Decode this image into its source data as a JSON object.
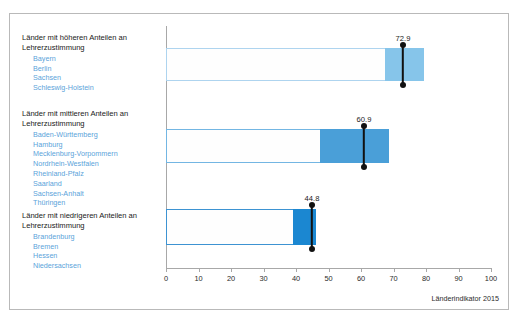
{
  "chart_data": {
    "type": "bar",
    "title": "",
    "xlabel": "",
    "ylabel": "",
    "xlim": [
      0,
      100
    ],
    "grid": false,
    "legend_position": "left-panel",
    "tick_labels": [
      "0",
      "10",
      "20",
      "30",
      "40",
      "50",
      "60",
      "70",
      "80",
      "90",
      "100"
    ],
    "tick_values": [
      0,
      10,
      20,
      30,
      40,
      50,
      60,
      70,
      80,
      90,
      100
    ],
    "categories": [
      "Länder mit höheren Anteilen an Lehrerzustimmung",
      "Länder mit mittleren Anteilen an Lehrerzustimmung",
      "Länder mit niedrigeren Anteilen an Lehrerzustimmung"
    ],
    "values": [
      72.9,
      60.9,
      44.8
    ],
    "series": [
      {
        "name": "Länder mit höheren Anteilen an Lehrerzustimmung",
        "value": 72.9,
        "value_label": "72.9",
        "box_start": 0,
        "box_end": 67.4,
        "band_start": 67.4,
        "band_end": 82.2,
        "fill_color": "#86c5ea",
        "outline_color": "#aed4ef"
      },
      {
        "name": "Länder mit mittleren Anteilen an Lehrerzustimmung",
        "value": 60.9,
        "value_label": "60.9",
        "box_start": 0,
        "box_end": 47.4,
        "band_start": 47.4,
        "band_end": 68.6,
        "fill_color": "#4a9fd8",
        "outline_color": "#73b6e3"
      },
      {
        "name": "Länder mit niedrigeren Anteilen an Lehrerzustimmung",
        "value": 44.8,
        "value_label": "44.8",
        "box_start": 0,
        "box_end": 39.1,
        "band_start": 39.1,
        "band_end": 46.2,
        "fill_color": "#1b87d1",
        "outline_color": "#3d93d2"
      }
    ]
  },
  "legend": {
    "groups": [
      {
        "title_line_1": "Länder mit höheren Anteilen an",
        "title_line_2": "Lehrerzustimmung",
        "states": [
          "Bayern",
          "Berlin",
          "Sachsen",
          "Schleswig-Holstein"
        ]
      },
      {
        "title_line_1": "Länder mit mittleren Anteilen an",
        "title_line_2": "Lehrerzustimmung",
        "states": [
          "Baden-Württemberg",
          "Hamburg",
          "Mecklenburg-Vorpommern",
          "Nordrhein-Westfalen",
          "Rheinland-Pfalz",
          "Saarland",
          "Sachsen-Anhalt",
          "Thüringen"
        ]
      },
      {
        "title_line_1": "Länder mit niedrigeren Anteilen an",
        "title_line_2": "Lehrerzustimmung",
        "states": [
          "Brandenburg",
          "Bremen",
          "Hessen",
          "Niedersachsen"
        ]
      }
    ]
  },
  "source": {
    "note": "Länderindikator 2015"
  },
  "colors": {
    "state_text": "#5ba3da",
    "axis": "#a8a8a8",
    "marker": "#111111",
    "border": "#b9b9b9"
  }
}
